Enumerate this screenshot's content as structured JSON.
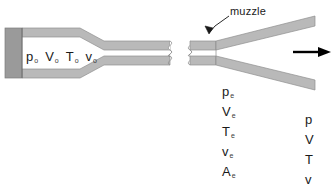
{
  "figure": {
    "muzzle_label": "muzzle",
    "colors": {
      "wall": "#b9b9b9",
      "wall_edge": "#8f8f8f",
      "endplate": "#9a9a9a",
      "endplate_edge": "#7d7d7d",
      "interior": "#ffffff",
      "line": "#555555",
      "arrow": "#000000",
      "text": "#1a1a1a"
    }
  },
  "chamber_states": {
    "name": "stagnation-conditions",
    "items": [
      {
        "symbol": "p",
        "subscript": "o"
      },
      {
        "symbol": "V",
        "subscript": "o"
      },
      {
        "symbol": "T",
        "subscript": "o"
      },
      {
        "symbol": "v",
        "subscript": "o"
      }
    ]
  },
  "throat_states": {
    "name": "exit-plane-conditions",
    "items": [
      {
        "symbol": "p",
        "subscript": "e"
      },
      {
        "symbol": "V",
        "subscript": "e"
      },
      {
        "symbol": "T",
        "subscript": "e"
      },
      {
        "symbol": "v",
        "subscript": "e"
      },
      {
        "symbol": "A",
        "subscript": "e"
      }
    ]
  },
  "exit_states": {
    "name": "downstream-conditions",
    "items": [
      {
        "symbol": "p",
        "subscript": ""
      },
      {
        "symbol": "V",
        "subscript": ""
      },
      {
        "symbol": "T",
        "subscript": ""
      },
      {
        "symbol": "v",
        "subscript": ""
      },
      {
        "symbol": "A",
        "subscript": ""
      }
    ]
  },
  "flow_arrow": {
    "name": "flow-direction-arrow",
    "direction": "right"
  }
}
